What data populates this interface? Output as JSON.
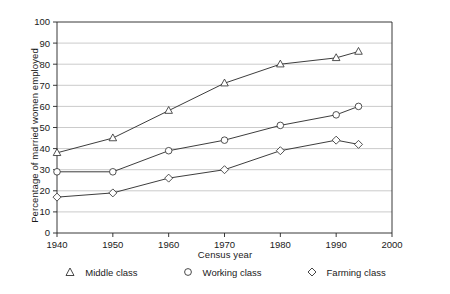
{
  "chart_data": {
    "type": "line",
    "title": "",
    "xlabel": "Census year",
    "ylabel": "Percentage of married women employed",
    "x": [
      1940,
      1950,
      1960,
      1970,
      1980,
      1990,
      1994
    ],
    "xlim": [
      1940,
      2000
    ],
    "ylim": [
      0,
      100
    ],
    "xticks": [
      "1940",
      "1950",
      "1960",
      "1970",
      "1980",
      "1990",
      "2000"
    ],
    "xtick_values": [
      1940,
      1950,
      1960,
      1970,
      1980,
      1990,
      2000
    ],
    "yticks": [
      "0",
      "10",
      "20",
      "30",
      "40",
      "50",
      "60",
      "70",
      "80",
      "90",
      "100"
    ],
    "ytick_values": [
      0,
      10,
      20,
      30,
      40,
      50,
      60,
      70,
      80,
      90,
      100
    ],
    "grid": true,
    "grid_axis": "y",
    "legend_position": "bottom",
    "series": [
      {
        "name": "Middle class",
        "marker": "triangle",
        "values": [
          38,
          45,
          58,
          71,
          80,
          83,
          86
        ]
      },
      {
        "name": "Working class",
        "marker": "circle",
        "values": [
          29,
          29,
          39,
          44,
          51,
          56,
          60
        ]
      },
      {
        "name": "Farming class",
        "marker": "diamond",
        "values": [
          17,
          19,
          26,
          30,
          39,
          44,
          42
        ]
      }
    ]
  },
  "legend": {
    "items": [
      {
        "label": "Middle class",
        "marker": "triangle-marker-icon"
      },
      {
        "label": "Working class",
        "marker": "circle-marker-icon"
      },
      {
        "label": "Farming class",
        "marker": "diamond-marker-icon"
      }
    ]
  },
  "colors": {
    "line": "#333333",
    "grid": "#b4b4b4",
    "axis": "#222222",
    "marker_fill": "#ffffff",
    "text": "#1a1a1a"
  }
}
